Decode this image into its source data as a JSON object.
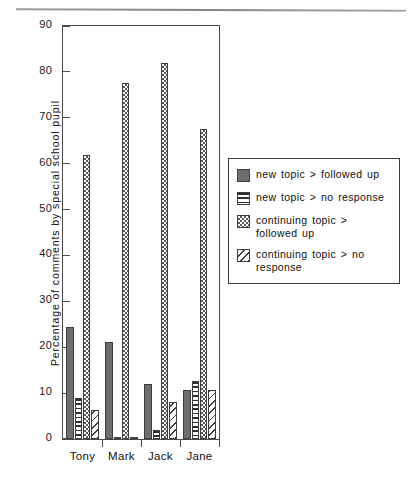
{
  "chart_data": {
    "type": "bar",
    "title": "",
    "xlabel": "",
    "ylabel": "Percentage of comments by special school pupil",
    "ylim": [
      0,
      90
    ],
    "yticks": [
      0,
      10,
      20,
      30,
      40,
      50,
      60,
      70,
      80,
      90
    ],
    "grid": false,
    "legend_position": "right",
    "categories": [
      "Tony",
      "Mark",
      "Jack",
      "Jane"
    ],
    "series": [
      {
        "name": "new topic > followed up",
        "pattern": "solid",
        "color": "#6f6e6e",
        "values": [
          24.5,
          21.2,
          12.0,
          10.7
        ]
      },
      {
        "name": "new topic > no response",
        "pattern": "horizontal-stripes",
        "color": "#2f2f2f",
        "values": [
          9.0,
          0.5,
          2.0,
          12.7
        ]
      },
      {
        "name": "continuing topic > followed up",
        "pattern": "checkerboard",
        "color": "#5c5b5b",
        "values": [
          62.0,
          77.5,
          82.0,
          67.5
        ]
      },
      {
        "name": "continuing topic > no response",
        "pattern": "diagonal-hatch",
        "color": "#3a3a3a",
        "values": [
          6.3,
          0.3,
          8.0,
          10.7
        ]
      }
    ]
  }
}
